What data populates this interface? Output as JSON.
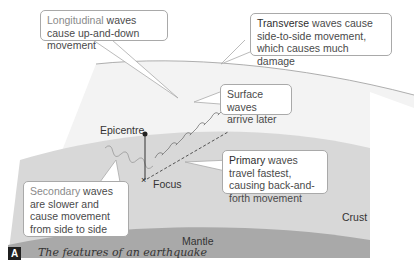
{
  "figure": {
    "badge": "A",
    "caption": "The features of an earthquake"
  },
  "callouts": {
    "longitudinal": {
      "keyword": "Longitudinal",
      "rest": " waves cause up-and-down movement"
    },
    "transverse": {
      "keyword": "Transverse",
      "rest": " waves cause side-to-side movement, which causes much damage"
    },
    "surface": {
      "text": "Surface waves arrive later"
    },
    "secondary": {
      "keyword": "Secondary",
      "rest": " waves are slower and cause movement from side to side"
    },
    "primary": {
      "keyword": "Primary",
      "rest": " waves travel fastest, causing back-and-forth movement"
    }
  },
  "labels": {
    "epicentre": "Epicentre",
    "focus": "Focus",
    "crust": "Crust",
    "mantle": "Mantle"
  },
  "colors": {
    "surface_layer": "#f2f2f2",
    "crust": "#d9d9d9",
    "mantle": "#a8a8a8",
    "callout_border": "#a9a9a9"
  }
}
